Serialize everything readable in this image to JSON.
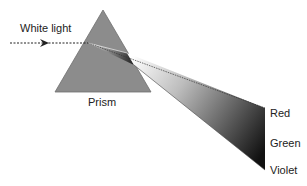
{
  "diagram": {
    "labels": {
      "input": "White light",
      "prism": "Prism",
      "spectrum": [
        "Red",
        "Green",
        "Violet"
      ]
    },
    "colors": {
      "prism_fill": "#8c8c8c",
      "prism_stroke": "#6e6e6e",
      "beam_dark": "#1a1a1a",
      "beam_light": "#f2f2f2",
      "text": "#222222"
    }
  }
}
